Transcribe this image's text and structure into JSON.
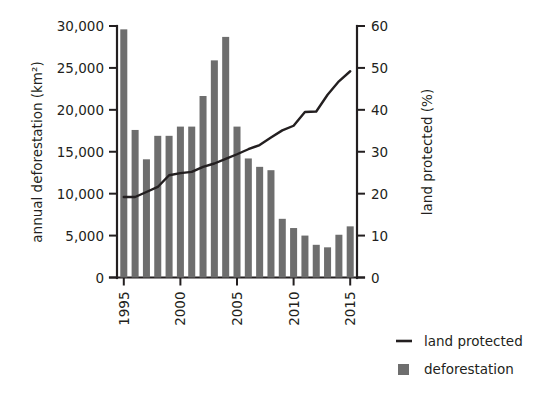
{
  "chart_data": {
    "type": "bar",
    "title": "",
    "subtitle": "",
    "xlabel": "",
    "ylabel": "annual deforestation (km²)",
    "y2label": "land protected (%)",
    "grid": false,
    "legend_position": "right-bottom",
    "x": [
      1995,
      1996,
      1997,
      1998,
      1999,
      2000,
      2001,
      2002,
      2003,
      2004,
      2005,
      2006,
      2007,
      2008,
      2009,
      2010,
      2011,
      2012,
      2013,
      2014,
      2015
    ],
    "categories": [
      "1995",
      "1996",
      "1997",
      "1998",
      "1999",
      "2000",
      "2001",
      "2002",
      "2003",
      "2004",
      "2005",
      "2006",
      "2007",
      "2008",
      "2009",
      "2010",
      "2011",
      "2012",
      "2013",
      "2014",
      "2015"
    ],
    "xlim": [
      1994.4,
      2015.6
    ],
    "xticks": [
      1995,
      2000,
      2005,
      2010,
      2015
    ],
    "xticklabels": [
      "1995",
      "2000",
      "2005",
      "2010",
      "2015"
    ],
    "ylim": [
      0,
      30000
    ],
    "yticks": [
      0,
      5000,
      10000,
      15000,
      20000,
      25000,
      30000
    ],
    "yticklabels": [
      "0",
      "5,000",
      "10,000",
      "15,000",
      "20,000",
      "25,000",
      "30,000"
    ],
    "y2lim": [
      0,
      60
    ],
    "y2ticks": [
      0,
      10,
      20,
      30,
      40,
      50,
      60
    ],
    "y2ticklabels": [
      "0",
      "10",
      "20",
      "30",
      "40",
      "50",
      "60"
    ],
    "series": [
      {
        "name": "deforestation",
        "type": "bar",
        "axis": "left",
        "units": "km²",
        "color": "#6e6e6e",
        "values": [
          29600,
          17600,
          14100,
          16900,
          16900,
          18000,
          18000,
          21650,
          25900,
          28700,
          18000,
          14200,
          13200,
          12800,
          7000,
          5900,
          5000,
          3900,
          3600,
          5100,
          6100
        ]
      },
      {
        "name": "land protected",
        "type": "line",
        "axis": "right",
        "units": "%",
        "color": "#231f20",
        "values": [
          19.2,
          19.2,
          20.4,
          21.6,
          24.4,
          24.9,
          25.2,
          26.4,
          27.2,
          28.3,
          29.4,
          30.6,
          31.6,
          33.4,
          35.1,
          36.2,
          39.5,
          39.6,
          43.6,
          46.8,
          49.2
        ]
      }
    ],
    "legend": [
      {
        "label": "land protected",
        "marker": "line",
        "color": "#231f20"
      },
      {
        "label": "deforestation",
        "marker": "square",
        "color": "#6e6e6e"
      }
    ]
  }
}
